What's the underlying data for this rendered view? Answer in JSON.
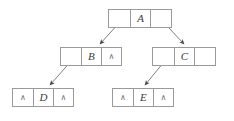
{
  "diagram": {
    "type": "binary-tree-linked-representation",
    "colors": {
      "background": "#ffffff",
      "node_border": "#9a9a9a",
      "label_text": "#3b3b3b",
      "null_marker": "#6d6d6d",
      "arrow": "#555555"
    },
    "null_marker": "∧",
    "nodes": [
      {
        "id": "A",
        "label": "A",
        "level": 0,
        "x": 108,
        "y": 9,
        "width": 64,
        "left": {
          "kind": "pointer",
          "text": ""
        },
        "right": {
          "kind": "pointer",
          "text": ""
        }
      },
      {
        "id": "B",
        "label": "B",
        "level": 1,
        "x": 60,
        "y": 47,
        "width": 62,
        "left": {
          "kind": "pointer",
          "text": ""
        },
        "right": {
          "kind": "null",
          "text": "∧"
        }
      },
      {
        "id": "C",
        "label": "C",
        "level": 1,
        "x": 152,
        "y": 47,
        "width": 64,
        "left": {
          "kind": "pointer",
          "text": ""
        },
        "right": {
          "kind": "empty",
          "text": ""
        }
      },
      {
        "id": "D",
        "label": "D",
        "level": 2,
        "x": 12,
        "y": 88,
        "width": 62,
        "left": {
          "kind": "null",
          "text": "∧"
        },
        "right": {
          "kind": "null",
          "text": "∧"
        }
      },
      {
        "id": "E",
        "label": "E",
        "level": 2,
        "x": 112,
        "y": 88,
        "width": 62,
        "left": {
          "kind": "null",
          "text": "∧"
        },
        "right": {
          "kind": "null",
          "text": "∧"
        }
      }
    ],
    "edges": [
      {
        "id": "a-to-b",
        "from": "A",
        "from_field": "left",
        "to": "B",
        "x1": 129,
        "y1": 12,
        "x2": 100,
        "y2": 44
      },
      {
        "id": "a-to-c",
        "from": "A",
        "from_field": "right",
        "to": "C",
        "x1": 154,
        "y1": 12,
        "x2": 184,
        "y2": 44
      },
      {
        "id": "b-to-d",
        "from": "B",
        "from_field": "left",
        "to": "D",
        "x1": 80,
        "y1": 51,
        "x2": 50,
        "y2": 85
      },
      {
        "id": "c-to-e",
        "from": "C",
        "from_field": "left",
        "to": "E",
        "x1": 173,
        "y1": 51,
        "x2": 145,
        "y2": 85
      }
    ]
  }
}
